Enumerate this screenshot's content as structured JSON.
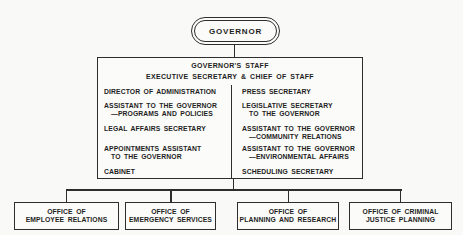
{
  "governor": {
    "label": "GOVERNOR"
  },
  "staff": {
    "title": "GOVERNOR'S STAFF",
    "subtitle": "EXECUTIVE SECRETARY & CHIEF OF STAFF",
    "left": [
      {
        "line1": "DIRECTOR OF ADMINISTRATION",
        "line2": ""
      },
      {
        "line1": "ASSISTANT TO THE GOVERNOR",
        "line2": "—PROGRAMS AND POLICIES"
      },
      {
        "line1": "LEGAL AFFAIRS SECRETARY",
        "line2": ""
      },
      {
        "line1": "APPOINTMENTS ASSISTANT",
        "line2": "TO THE GOVERNOR"
      },
      {
        "line1": "CABINET",
        "line2": ""
      }
    ],
    "right": [
      {
        "line1": "PRESS SECRETARY",
        "line2": ""
      },
      {
        "line1": "LEGISLATIVE SECRETARY",
        "line2": "TO THE GOVERNOR"
      },
      {
        "line1": "ASSISTANT TO THE GOVERNOR",
        "line2": "—COMMUNITY RELATIONS"
      },
      {
        "line1": "ASSISTANT TO THE GOVERNOR",
        "line2": "—ENVIRONMENTAL AFFAIRS"
      },
      {
        "line1": "SCHEDULING SECRETARY",
        "line2": ""
      }
    ]
  },
  "offices": [
    {
      "line1": "OFFICE OF",
      "line2": "EMPLOYEE RELATIONS"
    },
    {
      "line1": "OFFICE OF",
      "line2": "EMERGENCY SERVICES"
    },
    {
      "line1": "OFFICE OF",
      "line2": "PLANNING AND RESEARCH"
    },
    {
      "line1": "OFFICE OF CRIMINAL",
      "line2": "JUSTICE PLANNING"
    }
  ],
  "colors": {
    "line": "#2d2d2d",
    "background": "#f9f9f7",
    "box_fill": "#fbfbf9",
    "text": "#1e1e1e"
  }
}
